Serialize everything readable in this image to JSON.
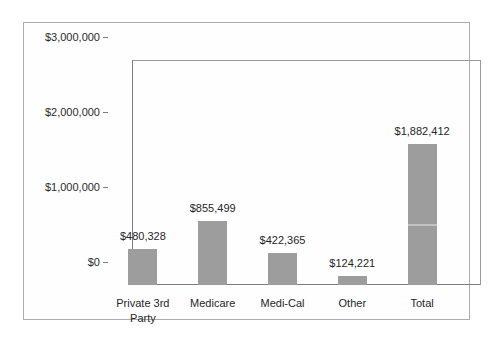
{
  "chart_data": {
    "type": "bar",
    "title": "",
    "xlabel": "",
    "ylabel": "",
    "categories": [
      "Private 3rd Party",
      "Medicare",
      "Medi-Cal",
      "Other",
      "Total"
    ],
    "values": [
      480328,
      855499,
      422365,
      124221,
      1882412
    ],
    "data_labels": [
      "$480,328",
      "$855,499",
      "$422,365",
      "$124,221",
      "$1,882,412"
    ],
    "ylim": [
      0,
      3000000
    ],
    "y_ticks": [
      {
        "value": 0,
        "label": "$0"
      },
      {
        "value": 1000000,
        "label": "$1,000,000"
      },
      {
        "value": 2000000,
        "label": "$2,000,000"
      },
      {
        "value": 3000000,
        "label": "$3,000,000"
      }
    ],
    "grid": false,
    "legend": false,
    "colors": {
      "bar_fill": "#9d9d9d",
      "axis_line": "#7d7d7d",
      "plot_border": "#9a9a9a",
      "outer_border": "#acacac",
      "text": "#262626",
      "background": "#ffffff"
    }
  }
}
